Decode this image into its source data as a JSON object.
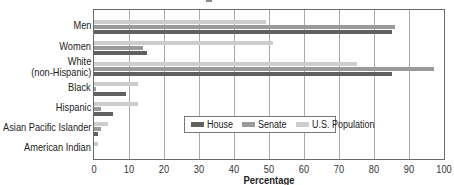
{
  "chart_data": {
    "type": "bar",
    "orientation": "horizontal",
    "title": "",
    "xlabel": "Percentage",
    "ylabel": "",
    "xlim": [
      0,
      100
    ],
    "xticks": [
      0,
      10,
      20,
      30,
      40,
      50,
      60,
      70,
      80,
      90,
      100
    ],
    "grid": true,
    "legend_position": "inside-lower-center",
    "categories": [
      "Men",
      "Women",
      "White (non-Hispanic)",
      "Black",
      "Hispanic",
      "Asian Pacific Islander",
      "American Indian"
    ],
    "category_labels": [
      [
        "Men"
      ],
      [
        "Women"
      ],
      [
        "White",
        "(non-Hispanic)"
      ],
      [
        "Black"
      ],
      [
        "Hispanic"
      ],
      [
        "Asian Pacific Islander"
      ],
      [
        "American Indian"
      ]
    ],
    "series": [
      {
        "name": "House",
        "color": "#606060",
        "values": [
          85,
          15,
          85,
          9,
          5.5,
          1,
          0
        ]
      },
      {
        "name": "Senate",
        "color": "#9a9a9a",
        "values": [
          86,
          14,
          97,
          0.5,
          2,
          2,
          0
        ]
      },
      {
        "name": "U.S. Population",
        "color": "#cdcdcd",
        "values": [
          49,
          51,
          75,
          12.5,
          12.5,
          4,
          1
        ]
      }
    ]
  }
}
